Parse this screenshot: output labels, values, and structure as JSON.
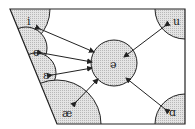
{
  "diagram": {
    "type": "vowel-quadrilateral",
    "colors": {
      "line": "#222222",
      "fill": "#d8d8d8",
      "background": "#ffffff"
    },
    "center": {
      "symbol": "ə",
      "label": "schwa"
    },
    "vowels": [
      {
        "symbol": "i",
        "position": "top-left"
      },
      {
        "symbol": "e",
        "position": "left-upper-mid"
      },
      {
        "symbol": "ɛ",
        "position": "left-lower-mid"
      },
      {
        "symbol": "æ",
        "position": "bottom-left"
      },
      {
        "symbol": "u",
        "position": "top-right"
      },
      {
        "symbol": "ɑ",
        "position": "bottom-right"
      }
    ],
    "arrows": [
      {
        "from": "ə",
        "to": "i"
      },
      {
        "from": "ə",
        "to": "e"
      },
      {
        "from": "ə",
        "to": "ɛ"
      },
      {
        "from": "ə",
        "to": "æ"
      },
      {
        "from": "ə",
        "to": "u"
      },
      {
        "from": "ə",
        "to": "ɑ"
      }
    ]
  }
}
